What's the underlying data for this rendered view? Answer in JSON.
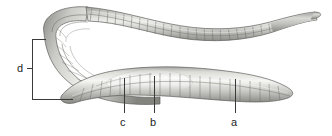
{
  "figure": {
    "kind": "anatomical-illustration",
    "background_color": "#ffffff",
    "line_color": "#3a3a3a",
    "text_color": "#1d1d1d",
    "body_light": "#f2f2f0",
    "body_mid": "#b8b8b4",
    "body_dark": "#7e7e7a",
    "outline": "#5a5a57"
  },
  "labels": {
    "a": "a",
    "b": "b",
    "c": "c",
    "d": "d"
  },
  "callouts": [
    {
      "id": "a",
      "label": "a",
      "leader": "vertical",
      "anchor_x": 235,
      "anchor_y": 79,
      "text_x": 231,
      "text_y": 117
    },
    {
      "id": "b",
      "label": "b",
      "leader": "vertical",
      "anchor_x": 154,
      "anchor_y": 76,
      "text_x": 150,
      "text_y": 117
    },
    {
      "id": "c",
      "label": "c",
      "leader": "vertical",
      "anchor_x": 124,
      "anchor_y": 78,
      "text_x": 120,
      "text_y": 117
    },
    {
      "id": "d",
      "label": "d",
      "leader": "bracket",
      "bracket_top_y": 39,
      "bracket_bottom_y": 99,
      "bracket_x": 32,
      "text_x": 17,
      "text_y": 63
    }
  ]
}
